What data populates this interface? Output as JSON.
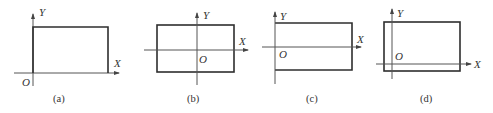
{
  "figure": {
    "panels": [
      {
        "caption": "(a)",
        "x_label": "X",
        "y_label": "Y",
        "origin_label": "O",
        "description": "Rectangle in first quadrant with bottom-left corner at origin"
      },
      {
        "caption": "(b)",
        "x_label": "X",
        "y_label": "Y",
        "origin_label": "O",
        "description": "Rectangle centered on origin"
      },
      {
        "caption": "(c)",
        "x_label": "X",
        "y_label": "Y",
        "origin_label": "O",
        "description": "Rectangle with left edge on Y axis, centered vertically on X axis"
      },
      {
        "caption": "(d)",
        "x_label": "X",
        "y_label": "Y",
        "origin_label": "O",
        "description": "Rectangle with origin near bottom-left corner inside"
      }
    ]
  }
}
